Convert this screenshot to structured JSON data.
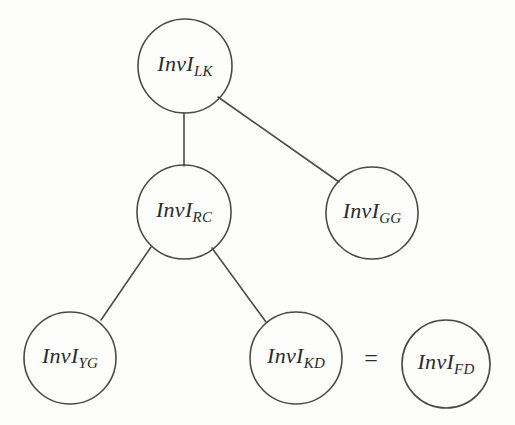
{
  "figure": {
    "type": "node-link-diagram",
    "background_color": "#fdfdfc",
    "stroke_color": "#4a4a4a",
    "text_color": "#2b2b2b",
    "width": 515,
    "height": 425
  },
  "nodes": [
    {
      "id": "lk",
      "base": "InvI",
      "sub": "LK",
      "cx": 185,
      "cy": 66,
      "r": 47
    },
    {
      "id": "rc",
      "base": "InvI",
      "sub": "RC",
      "cx": 184,
      "cy": 212,
      "r": 47
    },
    {
      "id": "gg",
      "base": "InvI",
      "sub": "GG",
      "cx": 372,
      "cy": 213,
      "r": 46
    },
    {
      "id": "yg",
      "base": "InvI",
      "sub": "YG",
      "cx": 70,
      "cy": 358,
      "r": 46
    },
    {
      "id": "kd",
      "base": "InvI",
      "sub": "KD",
      "cx": 296,
      "cy": 358,
      "r": 46
    },
    {
      "id": "fd",
      "base": "InvI",
      "sub": "FD",
      "cx": 446,
      "cy": 364,
      "r": 44
    }
  ],
  "edges": [
    {
      "id": "lk-rc",
      "from": "lk",
      "to": "rc",
      "x1": 184,
      "y1": 113,
      "x2": 184,
      "y2": 166
    },
    {
      "id": "lk-gg",
      "from": "lk",
      "to": "gg",
      "x1": 218,
      "y1": 97,
      "x2": 339,
      "y2": 182
    },
    {
      "id": "rc-yg",
      "from": "rc",
      "to": "yg",
      "x1": 151,
      "y1": 247,
      "x2": 101,
      "y2": 320
    },
    {
      "id": "rc-kd",
      "from": "rc",
      "to": "kd",
      "x1": 212,
      "y1": 248,
      "x2": 266,
      "y2": 322
    }
  ],
  "annotations": [
    {
      "id": "equality",
      "symbol": "=",
      "x": 371,
      "y": 358
    }
  ]
}
